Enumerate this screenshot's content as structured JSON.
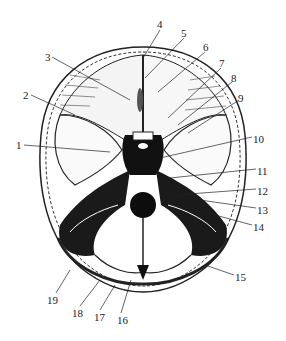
{
  "figure": {
    "labels": [
      {
        "n": "1",
        "x": 16,
        "y": 140
      },
      {
        "n": "2",
        "x": 23,
        "y": 90
      },
      {
        "n": "3",
        "x": 45,
        "y": 52
      },
      {
        "n": "4",
        "x": 157,
        "y": 19
      },
      {
        "n": "5",
        "x": 181,
        "y": 28
      },
      {
        "n": "6",
        "x": 203,
        "y": 42
      },
      {
        "n": "7",
        "x": 219,
        "y": 58
      },
      {
        "n": "8",
        "x": 231,
        "y": 73
      },
      {
        "n": "9",
        "x": 238,
        "y": 93
      },
      {
        "n": "10",
        "x": 253,
        "y": 134
      },
      {
        "n": "11",
        "x": 257,
        "y": 166
      },
      {
        "n": "12",
        "x": 257,
        "y": 186
      },
      {
        "n": "13",
        "x": 257,
        "y": 205
      },
      {
        "n": "14",
        "x": 253,
        "y": 222
      },
      {
        "n": "15",
        "x": 235,
        "y": 272
      },
      {
        "n": "16",
        "x": 117,
        "y": 315
      },
      {
        "n": "17",
        "x": 94,
        "y": 312
      },
      {
        "n": "18",
        "x": 72,
        "y": 308
      },
      {
        "n": "19",
        "x": 47,
        "y": 295
      }
    ]
  },
  "caption": {
    "text": "Fig. (partially visible, illegible)"
  }
}
